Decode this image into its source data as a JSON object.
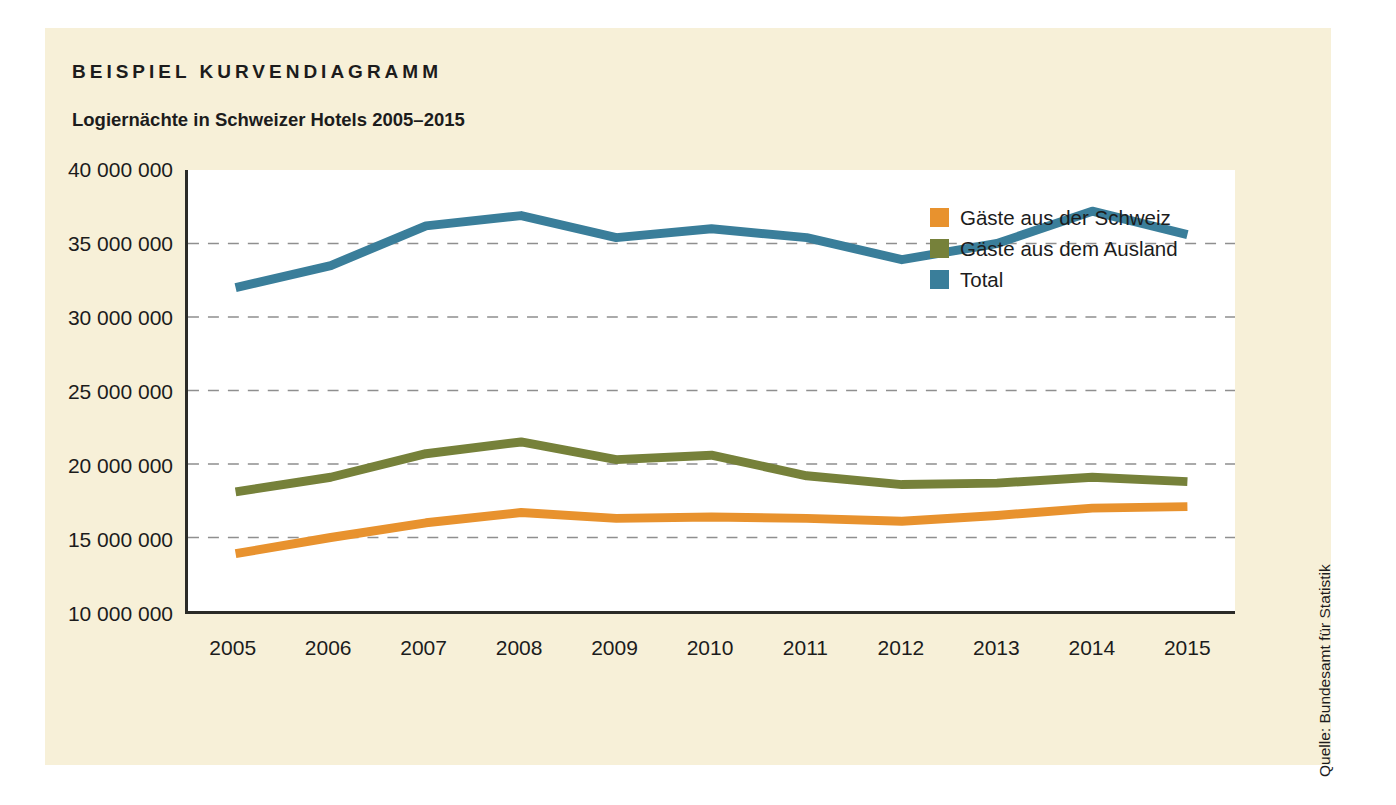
{
  "figure": {
    "kicker": "BEISPIEL KURVENDIAGRAMM",
    "subtitle": "Logiernächte in Schweizer Hotels 2005–2015",
    "source_note": "Quelle: Bundesamt für Statistik",
    "panel_color": "#f7f0d8",
    "plot_bg": "#ffffff",
    "axis_color": "#2b2b28",
    "grid_color": "#8f8f8f"
  },
  "chart_data": {
    "type": "line",
    "title": "Logiernächte in Schweizer Hotels 2005–2015",
    "xlabel": "",
    "ylabel": "",
    "categories": [
      "2005",
      "2006",
      "2007",
      "2008",
      "2009",
      "2010",
      "2011",
      "2012",
      "2013",
      "2014",
      "2015"
    ],
    "x": [
      2005,
      2006,
      2007,
      2008,
      2009,
      2010,
      2011,
      2012,
      2013,
      2014,
      2015
    ],
    "ylim": [
      10000000,
      40000000
    ],
    "ytick_values": [
      40000000,
      35000000,
      30000000,
      25000000,
      20000000,
      15000000,
      10000000
    ],
    "ytick_labels": [
      "40 000 000",
      "35 000 000",
      "30 000 000",
      "25 000 000",
      "20 000 000",
      "15 000 000",
      "10 000 000"
    ],
    "grid": "horizontal-dashed",
    "legend_position": "inside-right",
    "series": [
      {
        "name": "Gäste aus der Schweiz",
        "color": "#e8922e",
        "values": [
          13900000,
          15000000,
          16000000,
          16700000,
          16300000,
          16400000,
          16300000,
          16100000,
          16500000,
          17000000,
          17100000
        ]
      },
      {
        "name": "Gäste aus dem Ausland",
        "color": "#76813a",
        "values": [
          18100000,
          19100000,
          20700000,
          21500000,
          20300000,
          20600000,
          19200000,
          18600000,
          18700000,
          19100000,
          18800000
        ]
      },
      {
        "name": "Total",
        "color": "#3a7e9a",
        "values": [
          32000000,
          33500000,
          36200000,
          36900000,
          35400000,
          36000000,
          35400000,
          33900000,
          35000000,
          37200000,
          35600000
        ]
      }
    ]
  },
  "legend": {
    "items": [
      {
        "label": "Gäste aus der Schweiz",
        "color": "#e8922e"
      },
      {
        "label": "Gäste aus dem Ausland",
        "color": "#76813a"
      },
      {
        "label": "Total",
        "color": "#3a7e9a"
      }
    ]
  }
}
